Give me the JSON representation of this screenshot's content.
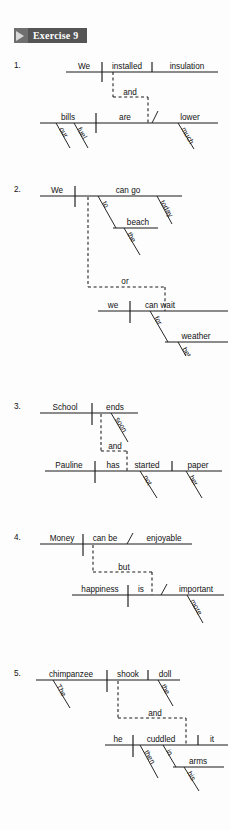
{
  "page": {
    "width": 230,
    "height": 830,
    "background": "#fdfdfd",
    "ink": "#111111"
  },
  "header": {
    "arrow_icon": "triangle-right-icon",
    "label": "Exercise 9",
    "bar_color": "#555555",
    "arrow_block_color": "#6f6f6f"
  },
  "exercise": {
    "title": "Exercise 9",
    "type": "sentence-diagramming",
    "item_count": 5
  },
  "items": [
    {
      "number": "1.",
      "sentence": "We installed insulation and our fuel bills are much lower.",
      "conjunction": "and",
      "clauses": [
        {
          "subject": "We",
          "verb": "installed",
          "object": "insulation",
          "modifiers": []
        },
        {
          "subject": "bills",
          "verb": "are",
          "complement": "lower",
          "modifiers": [
            "our",
            "fuel",
            "much"
          ]
        }
      ],
      "words": {
        "w1": "We",
        "w2": "installed",
        "w3": "insulation",
        "conj": "and",
        "w4": "bills",
        "w5": "are",
        "w6": "lower",
        "m1": "our",
        "m2": "fuel",
        "m3": "much"
      }
    },
    {
      "number": "2.",
      "sentence": "We can go to the beach today or we can wait for better weather.",
      "conjunction": "or",
      "clauses": [
        {
          "subject": "We",
          "verb": "can go",
          "modifiers": [
            "today",
            "to",
            "the",
            "beach"
          ]
        },
        {
          "subject": "we",
          "verb": "can wait",
          "modifiers": [
            "for",
            "weather",
            "better"
          ]
        }
      ],
      "words": {
        "w1": "We",
        "w2": "can go",
        "prep1": "to",
        "obj1": "beach",
        "m1": "the",
        "m2": "today",
        "conj": "or",
        "w3": "we",
        "w4": "can wait",
        "prep2": "for",
        "obj2": "weather",
        "m3": "better"
      }
    },
    {
      "number": "3.",
      "sentence": "School ends soon and Pauline has not started her paper.",
      "conjunction": "and",
      "clauses": [
        {
          "subject": "School",
          "verb": "ends",
          "modifiers": [
            "soon"
          ]
        },
        {
          "subject": "Pauline",
          "verb": "has started",
          "object": "paper",
          "modifiers": [
            "not",
            "her"
          ]
        }
      ],
      "words": {
        "w1": "School",
        "w2": "ends",
        "m1": "soon",
        "conj": "and",
        "w3": "Pauline",
        "w4": "has",
        "w5": "started",
        "m2": "not",
        "w6": "paper",
        "m3": "her"
      }
    },
    {
      "number": "4.",
      "sentence": "Money can be enjoyable but happiness is more important.",
      "conjunction": "but",
      "clauses": [
        {
          "subject": "Money",
          "verb": "can be",
          "complement": "enjoyable",
          "modifiers": []
        },
        {
          "subject": "happiness",
          "verb": "is",
          "complement": "important",
          "modifiers": [
            "more"
          ]
        }
      ],
      "words": {
        "w1": "Money",
        "w2": "can be",
        "w3": "enjoyable",
        "conj": "but",
        "w4": "happiness",
        "w5": "is",
        "w6": "important",
        "m1": "more"
      }
    },
    {
      "number": "5.",
      "sentence": "The chimpanzee shook the doll and then he cuddled it in his arms.",
      "conjunction": "and",
      "clauses": [
        {
          "subject": "chimpanzee",
          "verb": "shook",
          "object": "doll",
          "modifiers": [
            "The",
            "the"
          ]
        },
        {
          "subject": "he",
          "verb": "cuddled",
          "object": "it",
          "modifiers": [
            "then",
            "in",
            "his",
            "arms"
          ]
        }
      ],
      "words": {
        "w1": "chimpanzee",
        "w2": "shook",
        "w3": "doll",
        "m1": "The",
        "m2": "the",
        "conj": "and",
        "w4": "he",
        "w5": "cuddled",
        "w6": "it",
        "m3": "then",
        "prep": "in",
        "obj": "arms",
        "m4": "his"
      }
    }
  ]
}
